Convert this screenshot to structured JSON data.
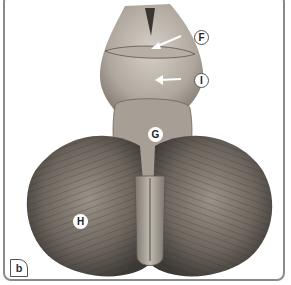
{
  "figure": {
    "panel_label": "b",
    "labels": [
      {
        "id": "F",
        "text": "F",
        "style": "outline",
        "has_arrow": true
      },
      {
        "id": "I",
        "text": "I",
        "style": "outline",
        "has_arrow": true
      },
      {
        "id": "G",
        "text": "G",
        "style": "filled"
      },
      {
        "id": "H",
        "text": "H",
        "style": "filled"
      }
    ],
    "colors": {
      "border": "#8a8a8a",
      "background": "#ffffff",
      "tissue_light": "#c9c2b8",
      "tissue_mid": "#8f877d",
      "tissue_dark": "#4a4540"
    }
  }
}
